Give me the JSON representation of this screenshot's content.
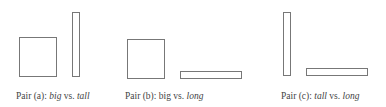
{
  "stroke_color": "#777777",
  "pairs": [
    {
      "id": "a",
      "caption": {
        "prefix": "Pair (a): ",
        "first": "big",
        "vs": " vs. ",
        "second": "tall"
      },
      "first_italic": true,
      "second_italic": true,
      "shapes": [
        {
          "kind": "big",
          "x": 19,
          "y": 37,
          "w": 38,
          "h": 40
        },
        {
          "kind": "tall",
          "x": 72,
          "y": 12,
          "w": 8,
          "h": 65
        }
      ]
    },
    {
      "id": "b",
      "caption": {
        "prefix": "Pair (b): ",
        "first": "big",
        "vs": " vs. ",
        "second": "long"
      },
      "first_italic": false,
      "second_italic": true,
      "shapes": [
        {
          "kind": "big",
          "x": 127,
          "y": 39,
          "w": 38,
          "h": 40
        },
        {
          "kind": "long",
          "x": 180,
          "y": 71,
          "w": 62,
          "h": 8
        }
      ]
    },
    {
      "id": "c",
      "caption": {
        "prefix": "Pair (c): ",
        "first": "tall",
        "vs": " vs. ",
        "second": "long"
      },
      "first_italic": true,
      "second_italic": true,
      "shapes": [
        {
          "kind": "tall",
          "x": 283,
          "y": 12,
          "w": 8,
          "h": 64
        },
        {
          "kind": "long",
          "x": 306,
          "y": 68,
          "w": 62,
          "h": 8
        }
      ]
    }
  ]
}
